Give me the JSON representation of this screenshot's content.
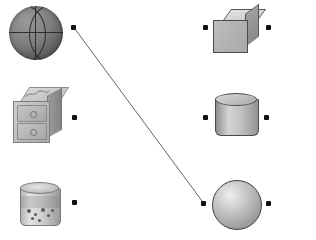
{
  "worksheet": {
    "title": "Match objects to solid shapes",
    "background_color": "#ffffff",
    "width": 316,
    "height": 240,
    "dot_color": "#111111",
    "line_color": "#666666"
  },
  "left_column": {
    "heading": "Real-world objects",
    "items": [
      {
        "id": "basketball",
        "label": "Basketball",
        "icon": "basketball-icon",
        "dot": {
          "x": 73,
          "y": 27
        },
        "matches": "sphere"
      },
      {
        "id": "chest-of-drawers",
        "label": "Chest of drawers",
        "icon": "chest-of-drawers-icon",
        "dot": {
          "x": 74,
          "y": 117
        },
        "matches": "cube"
      },
      {
        "id": "food-can",
        "label": "Food can",
        "icon": "can-icon",
        "dot": {
          "x": 74,
          "y": 202
        },
        "matches": "cylinder"
      }
    ]
  },
  "right_column": {
    "heading": "Solid shapes",
    "items": [
      {
        "id": "cube",
        "label": "Cube",
        "icon": "cube-icon",
        "left_dot": {
          "x": 205,
          "y": 27
        },
        "right_dot": {
          "x": 268,
          "y": 27
        }
      },
      {
        "id": "cylinder",
        "label": "Cylinder",
        "icon": "cylinder-icon",
        "left_dot": {
          "x": 205,
          "y": 117
        },
        "right_dot": {
          "x": 266,
          "y": 117
        }
      },
      {
        "id": "sphere",
        "label": "Sphere",
        "icon": "sphere-icon",
        "left_dot": {
          "x": 203,
          "y": 203
        },
        "right_dot": {
          "x": 268,
          "y": 203
        }
      }
    ]
  },
  "connections": [
    {
      "id": "basketball-to-sphere",
      "from": "basketball",
      "to": "sphere",
      "x1": 75,
      "y1": 29,
      "x2": 205,
      "y2": 205,
      "color": "#666666",
      "width": 1
    }
  ]
}
